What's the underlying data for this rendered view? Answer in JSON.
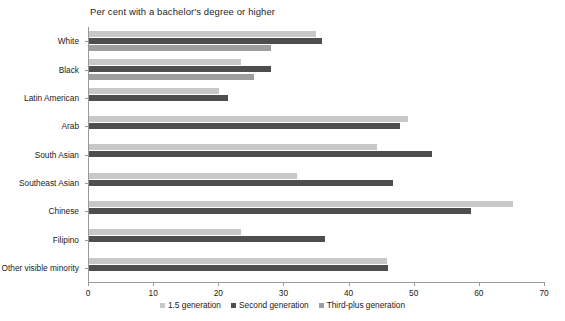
{
  "chart_data": {
    "type": "bar",
    "orientation": "horizontal",
    "title": "Per cent with a bachelor's degree or higher",
    "xlabel": "",
    "ylabel": "",
    "xlim": [
      0,
      70
    ],
    "xticks": [
      0,
      10,
      20,
      30,
      40,
      50,
      60,
      70
    ],
    "grid": false,
    "legend_position": "bottom",
    "categories": [
      "White",
      "Black",
      "Latin American",
      "Arab",
      "South Asian",
      "Southeast Asian",
      "Chinese",
      "Filipino",
      "Other visible minority"
    ],
    "series": [
      {
        "name": "1.5 generation",
        "color": "#c8c8c8",
        "values": [
          34.8,
          23.3,
          19.9,
          48.9,
          44.2,
          32.0,
          65.1,
          23.4,
          45.8
        ]
      },
      {
        "name": "Second generation",
        "color": "#4e4e4e",
        "values": [
          35.8,
          28.0,
          21.4,
          47.8,
          52.7,
          46.6,
          58.7,
          36.3,
          45.9
        ]
      },
      {
        "name": "Third-plus generation",
        "color": "#9e9e9e",
        "values": [
          27.9,
          25.4,
          0.0,
          0.0,
          0.0,
          0.0,
          0.0,
          0.0,
          0.0
        ]
      }
    ]
  },
  "legend": {
    "items": [
      {
        "label": "1.5 generation",
        "color": "#c8c8c8"
      },
      {
        "label": "Second generation",
        "color": "#4e4e4e"
      },
      {
        "label": "Third-plus generation",
        "color": "#9e9e9e"
      }
    ]
  }
}
